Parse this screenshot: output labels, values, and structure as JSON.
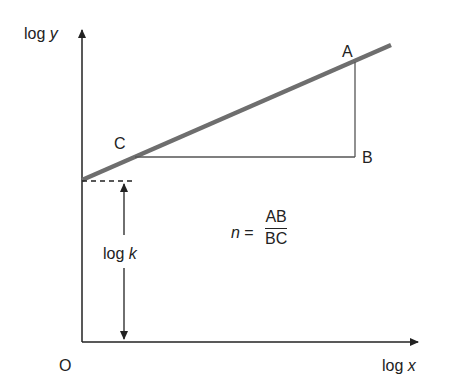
{
  "diagram": {
    "axes": {
      "y_label_prefix": "log",
      "y_label_var": "y",
      "x_label_prefix": "log",
      "x_label_var": "x",
      "origin_label": "O"
    },
    "points": {
      "A": "A",
      "B": "B",
      "C": "C"
    },
    "intercept_label_prefix": "log",
    "intercept_label_var": "k",
    "formula": {
      "lhs": "n",
      "equals": "=",
      "numerator": "AB",
      "denominator": "BC"
    },
    "colors": {
      "line": "#6e6e6e",
      "axes": "#222222",
      "triangle": "#555555"
    }
  }
}
